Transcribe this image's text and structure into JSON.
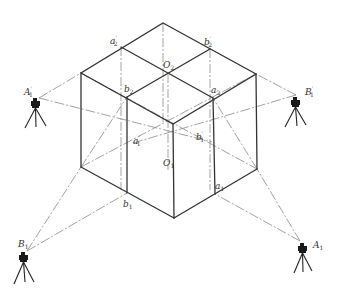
{
  "diagram": {
    "title": "",
    "colors": {
      "edge": "#333333",
      "hidden_line": "#9a9a9a",
      "sight_line": "#8a8a8a",
      "instrument": "#1a1a1a"
    },
    "stations": [
      {
        "id": "A1p",
        "label": "A",
        "sub": "1",
        "prime": true,
        "x": 39,
        "y": 98
      },
      {
        "id": "B1p",
        "label": "B",
        "sub": "1",
        "prime": true,
        "x": 296,
        "y": 95
      },
      {
        "id": "B1",
        "label": "B",
        "sub": "1",
        "prime": false,
        "x": 27,
        "y": 251
      },
      {
        "id": "A1",
        "label": "A",
        "sub": "1",
        "prime": false,
        "x": 300,
        "y": 241
      }
    ],
    "points": [
      {
        "id": "a2p",
        "label": "a",
        "sub": "2",
        "prime": true
      },
      {
        "id": "b2p",
        "label": "b",
        "sub": "2",
        "prime": true
      },
      {
        "id": "O2",
        "label": "O",
        "sub": "2",
        "prime": false
      },
      {
        "id": "b2",
        "label": "b",
        "sub": "2",
        "prime": false
      },
      {
        "id": "a2",
        "label": "a",
        "sub": "2",
        "prime": false
      },
      {
        "id": "a1p",
        "label": "a",
        "sub": "1",
        "prime": true
      },
      {
        "id": "b1p",
        "label": "b",
        "sub": "1",
        "prime": true
      },
      {
        "id": "O1",
        "label": "O",
        "sub": "1",
        "prime": false
      },
      {
        "id": "a1",
        "label": "a",
        "sub": "1",
        "prime": false
      },
      {
        "id": "b1",
        "label": "b",
        "sub": "1",
        "prime": false
      }
    ],
    "labels": {
      "a2p": "a",
      "a2p_sub": "2",
      "a2p_prime": "′",
      "b2p": "b",
      "b2p_sub": "2",
      "b2p_prime": "′",
      "O2": "O",
      "O2_sub": "2",
      "b2": "b",
      "b2_sub": "2",
      "a2": "a",
      "a2_sub": "2",
      "a1p": "a",
      "a1p_sub": "1",
      "a1p_prime": "′",
      "b1p": "b",
      "b1p_sub": "1",
      "b1p_prime": "′",
      "O1": "O",
      "O1_sub": "1",
      "a1": "a",
      "a1_sub": "1",
      "b1": "b",
      "b1_sub": "1",
      "A1p": "A",
      "A1p_sub": "1",
      "A1p_prime": "′",
      "B1p": "B",
      "B1p_sub": "1",
      "B1p_prime": "′",
      "B1": "B",
      "B1_sub": "1",
      "A1": "A",
      "A1_sub": "1"
    }
  }
}
